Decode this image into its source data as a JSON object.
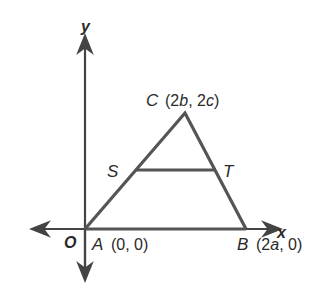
{
  "diagram": {
    "axes": {
      "x_label": "x",
      "y_label": "y",
      "origin_label": "O"
    },
    "points": {
      "A": {
        "name": "A",
        "coords": "(0, 0)"
      },
      "B": {
        "name": "B",
        "coords_prefix": "(2",
        "coords_var": "a",
        "coords_suffix": ", 0)"
      },
      "C": {
        "name": "C",
        "coords_prefix": "(2",
        "coords_var1": "b",
        "coords_mid": ", 2",
        "coords_var2": "c",
        "coords_suffix": ")"
      },
      "S": {
        "name": "S"
      },
      "T": {
        "name": "T"
      }
    },
    "colors": {
      "line": "#555555",
      "text": "#2a2a2a"
    }
  }
}
